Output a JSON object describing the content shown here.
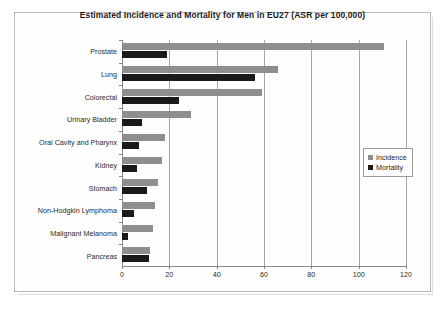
{
  "chart_data": {
    "type": "bar",
    "orientation": "horizontal",
    "title": "Estimated  Incidence and Mortality for Men in EU27 (ASR per 100,000)",
    "xlabel": "",
    "ylabel": "",
    "xlim": [
      0,
      120
    ],
    "xticks": [
      0,
      20,
      40,
      60,
      80,
      100,
      120
    ],
    "grid": true,
    "legend_position": "right",
    "categories": [
      "Prostate",
      "Lung",
      "Colorectal",
      "Urinary Bladder",
      "Oral Cavity and Pharynx",
      "Kidney",
      "Stomach",
      "Non-Hodgkin Lymphoma",
      "Malignant Melanoma",
      "Pancreas"
    ],
    "series": [
      {
        "name": "Incidence",
        "color": "#8e8e8e",
        "values": [
          110.5,
          66,
          59,
          29,
          18,
          17,
          15,
          14,
          13,
          12
        ]
      },
      {
        "name": "Mortality",
        "color": "#1a1a1a",
        "values": [
          19,
          56,
          24,
          8.5,
          7,
          6.5,
          10.5,
          5,
          2.5,
          11.5
        ]
      }
    ]
  }
}
